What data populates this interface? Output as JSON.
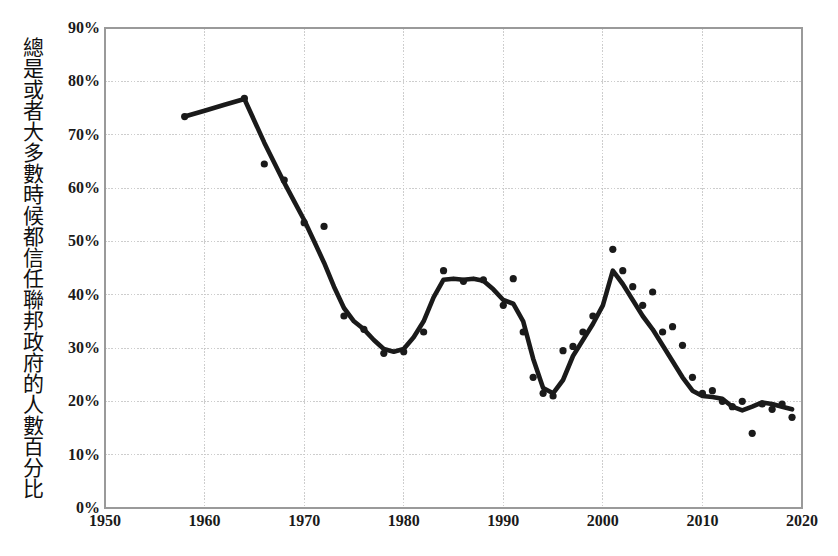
{
  "chart_data": {
    "type": "line",
    "title": "",
    "subtitle": "",
    "xlabel": "",
    "ylabel": "總是或者大多數時候都信任聯邦政府的人數百分比",
    "xlim": [
      1950,
      2020
    ],
    "ylim": [
      0,
      90
    ],
    "grid": true,
    "legend": false,
    "x_ticks": [
      "1950",
      "1960",
      "1970",
      "1980",
      "1990",
      "2000",
      "2010",
      "2020"
    ],
    "x_tick_values": [
      1950,
      1960,
      1970,
      1980,
      1990,
      2000,
      2010,
      2020
    ],
    "y_ticks": [
      "0%",
      "10%",
      "20%",
      "30%",
      "40%",
      "50%",
      "60%",
      "70%",
      "80%",
      "90%"
    ],
    "y_tick_values": [
      0,
      10,
      20,
      30,
      40,
      50,
      60,
      70,
      80,
      90
    ],
    "marker_color": "#1a1a1a",
    "line_color": "#1a1a1a",
    "grid_color": "#c8c8c8",
    "axis_color": "#9a9a9a",
    "background_color": "#ffffff",
    "series": [
      {
        "name": "survey-points",
        "type": "scatter",
        "points": [
          {
            "x": 1958,
            "y": 73.4
          },
          {
            "x": 1964,
            "y": 76.8
          },
          {
            "x": 1966,
            "y": 64.5
          },
          {
            "x": 1968,
            "y": 61.5
          },
          {
            "x": 1970,
            "y": 53.5
          },
          {
            "x": 1972,
            "y": 52.8
          },
          {
            "x": 1974,
            "y": 36.0
          },
          {
            "x": 1976,
            "y": 33.5
          },
          {
            "x": 1978,
            "y": 29.0
          },
          {
            "x": 1980,
            "y": 29.3
          },
          {
            "x": 1982,
            "y": 33.0
          },
          {
            "x": 1984,
            "y": 44.5
          },
          {
            "x": 1986,
            "y": 42.5
          },
          {
            "x": 1988,
            "y": 42.8
          },
          {
            "x": 1990,
            "y": 38.0
          },
          {
            "x": 1991,
            "y": 43.0
          },
          {
            "x": 1992,
            "y": 33.0
          },
          {
            "x": 1993,
            "y": 24.5
          },
          {
            "x": 1994,
            "y": 21.5
          },
          {
            "x": 1995,
            "y": 21.0
          },
          {
            "x": 1996,
            "y": 29.5
          },
          {
            "x": 1997,
            "y": 30.3
          },
          {
            "x": 1998,
            "y": 33.0
          },
          {
            "x": 1999,
            "y": 36.0
          },
          {
            "x": 2001,
            "y": 48.5
          },
          {
            "x": 2002,
            "y": 44.5
          },
          {
            "x": 2003,
            "y": 41.5
          },
          {
            "x": 2004,
            "y": 38.0
          },
          {
            "x": 2005,
            "y": 40.5
          },
          {
            "x": 2006,
            "y": 33.0
          },
          {
            "x": 2007,
            "y": 34.0
          },
          {
            "x": 2008,
            "y": 30.5
          },
          {
            "x": 2009,
            "y": 24.5
          },
          {
            "x": 2010,
            "y": 21.5
          },
          {
            "x": 2011,
            "y": 22.0
          },
          {
            "x": 2012,
            "y": 20.0
          },
          {
            "x": 2013,
            "y": 19.0
          },
          {
            "x": 2014,
            "y": 20.0
          },
          {
            "x": 2015,
            "y": 14.0
          },
          {
            "x": 2016,
            "y": 19.5
          },
          {
            "x": 2017,
            "y": 18.5
          },
          {
            "x": 2018,
            "y": 19.5
          },
          {
            "x": 2019,
            "y": 17.0
          }
        ]
      },
      {
        "name": "smoothed-trend",
        "type": "line",
        "points": [
          {
            "x": 1958,
            "y": 73.4
          },
          {
            "x": 1960,
            "y": 74.5
          },
          {
            "x": 1962,
            "y": 75.6
          },
          {
            "x": 1964,
            "y": 76.7
          },
          {
            "x": 1966,
            "y": 68.5
          },
          {
            "x": 1968,
            "y": 61.0
          },
          {
            "x": 1969,
            "y": 57.5
          },
          {
            "x": 1970,
            "y": 54.0
          },
          {
            "x": 1971,
            "y": 50.0
          },
          {
            "x": 1972,
            "y": 46.0
          },
          {
            "x": 1973,
            "y": 41.5
          },
          {
            "x": 1974,
            "y": 37.5
          },
          {
            "x": 1975,
            "y": 35.0
          },
          {
            "x": 1976,
            "y": 33.5
          },
          {
            "x": 1977,
            "y": 31.5
          },
          {
            "x": 1978,
            "y": 29.8
          },
          {
            "x": 1979,
            "y": 29.3
          },
          {
            "x": 1980,
            "y": 29.8
          },
          {
            "x": 1981,
            "y": 32.0
          },
          {
            "x": 1982,
            "y": 35.0
          },
          {
            "x": 1983,
            "y": 39.5
          },
          {
            "x": 1984,
            "y": 42.8
          },
          {
            "x": 1985,
            "y": 43.0
          },
          {
            "x": 1986,
            "y": 42.8
          },
          {
            "x": 1987,
            "y": 43.0
          },
          {
            "x": 1988,
            "y": 42.6
          },
          {
            "x": 1989,
            "y": 41.0
          },
          {
            "x": 1990,
            "y": 39.0
          },
          {
            "x": 1991,
            "y": 38.3
          },
          {
            "x": 1992,
            "y": 35.0
          },
          {
            "x": 1993,
            "y": 28.0
          },
          {
            "x": 1994,
            "y": 22.5
          },
          {
            "x": 1995,
            "y": 21.5
          },
          {
            "x": 1996,
            "y": 24.0
          },
          {
            "x": 1997,
            "y": 28.5
          },
          {
            "x": 1998,
            "y": 31.5
          },
          {
            "x": 1999,
            "y": 34.5
          },
          {
            "x": 2000,
            "y": 38.0
          },
          {
            "x": 2001,
            "y": 44.5
          },
          {
            "x": 2002,
            "y": 42.0
          },
          {
            "x": 2003,
            "y": 39.0
          },
          {
            "x": 2004,
            "y": 36.0
          },
          {
            "x": 2005,
            "y": 33.5
          },
          {
            "x": 2006,
            "y": 30.5
          },
          {
            "x": 2007,
            "y": 27.5
          },
          {
            "x": 2008,
            "y": 24.5
          },
          {
            "x": 2009,
            "y": 22.0
          },
          {
            "x": 2010,
            "y": 21.0
          },
          {
            "x": 2011,
            "y": 20.8
          },
          {
            "x": 2012,
            "y": 20.5
          },
          {
            "x": 2013,
            "y": 19.0
          },
          {
            "x": 2014,
            "y": 18.3
          },
          {
            "x": 2015,
            "y": 19.0
          },
          {
            "x": 2016,
            "y": 19.8
          },
          {
            "x": 2017,
            "y": 19.5
          },
          {
            "x": 2018,
            "y": 19.0
          },
          {
            "x": 2019,
            "y": 18.5
          }
        ]
      }
    ]
  },
  "axis": {
    "y_title": "總是或者大多數時候都信任聯邦政府的人數百分比"
  }
}
